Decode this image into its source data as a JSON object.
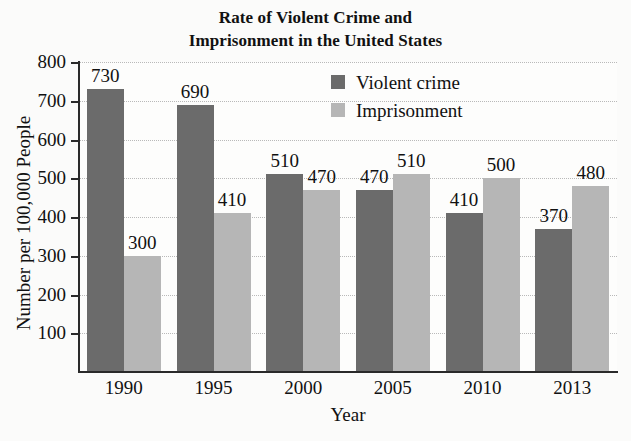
{
  "chart_data": {
    "type": "bar",
    "title": "Rate of Violent Crime and Imprisonment in the United States",
    "title_line1": "Rate of Violent Crime and",
    "title_line2": "Imprisonment in the United States",
    "xlabel": "Year",
    "ylabel": "Number per 100,000 People",
    "categories": [
      "1990",
      "1995",
      "2000",
      "2005",
      "2010",
      "2013"
    ],
    "series": [
      {
        "name": "Violent crime",
        "color": "#6b6b6b",
        "values": [
          730,
          690,
          510,
          470,
          410,
          370
        ]
      },
      {
        "name": "Imprisonment",
        "color": "#b6b6b6",
        "values": [
          300,
          410,
          470,
          510,
          500,
          480
        ]
      }
    ],
    "ylim": [
      0,
      800
    ],
    "yticks": [
      100,
      200,
      300,
      400,
      500,
      600,
      700,
      800
    ],
    "ytick_labels": [
      "100",
      "200",
      "300",
      "400",
      "500",
      "600",
      "700",
      "800"
    ],
    "grid": true,
    "legend_position": "top-center"
  }
}
